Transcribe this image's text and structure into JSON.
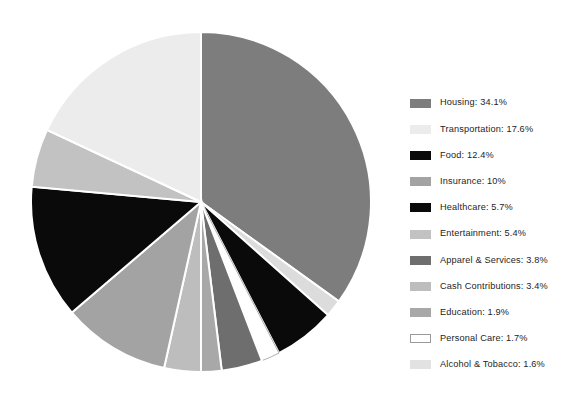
{
  "chart_data": {
    "type": "pie",
    "title": "",
    "categories": [
      "Housing",
      "Transportation",
      "Food",
      "Insurance",
      "Healthcare",
      "Entertainment",
      "Apparel & Services",
      "Cash Contributions",
      "Education",
      "Personal Care",
      "Alcohol & Tobacco"
    ],
    "values": [
      34.1,
      17.6,
      12.4,
      10,
      5.7,
      5.4,
      3.8,
      3.4,
      1.9,
      1.7,
      1.6
    ],
    "value_unit": "%",
    "start_angle_deg": 0,
    "direction": "clockwise",
    "legend_position": "right",
    "grid": false,
    "slice_order_clockwise_from_top": [
      "Housing",
      "Alcohol & Tobacco",
      "Healthcare",
      "Personal Care",
      "Apparel & Services",
      "Education",
      "Cash Contributions",
      "Insurance",
      "Food",
      "Entertainment",
      "Transportation"
    ],
    "colors": {
      "Housing": "#7d7d7d",
      "Transportation": "#ececec",
      "Food": "#0a0a0a",
      "Insurance": "#a3a3a3",
      "Healthcare": "#0a0a0a",
      "Entertainment": "#c2c2c2",
      "Apparel & Services": "#6e6e6e",
      "Cash Contributions": "#bdbdbd",
      "Education": "#a8a8a8",
      "Personal Care": "#ffffff",
      "Alcohol & Tobacco": "#dcdcdc"
    },
    "slice_border_color": "#ffffff",
    "personal_care_outline_color": "#9a9a9a"
  },
  "legend": {
    "items": [
      {
        "label": "Housing: 34.1%",
        "name": "housing",
        "color": "#7d7d7d",
        "outline": false
      },
      {
        "label": "Transportation: 17.6%",
        "name": "transportation",
        "color": "#ececec",
        "outline": false
      },
      {
        "label": "Food: 12.4%",
        "name": "food",
        "color": "#0a0a0a",
        "outline": false
      },
      {
        "label": "Insurance: 10%",
        "name": "insurance",
        "color": "#a3a3a3",
        "outline": false
      },
      {
        "label": "Healthcare: 5.7%",
        "name": "healthcare",
        "color": "#0a0a0a",
        "outline": false
      },
      {
        "label": "Entertainment: 5.4%",
        "name": "entertainment",
        "color": "#c2c2c2",
        "outline": false
      },
      {
        "label": "Apparel & Services: 3.8%",
        "name": "apparel-and-services",
        "color": "#6e6e6e",
        "outline": false
      },
      {
        "label": "Cash Contributions: 3.4%",
        "name": "cash-contributions",
        "color": "#bdbdbd",
        "outline": false
      },
      {
        "label": "Education: 1.9%",
        "name": "education",
        "color": "#a8a8a8",
        "outline": false
      },
      {
        "label": "Personal Care: 1.7%",
        "name": "personal-care",
        "color": "#ffffff",
        "outline": true
      },
      {
        "label": "Alcohol & Tobacco: 1.6%",
        "name": "alcohol-and-tobacco",
        "color": "#e2e2e2",
        "outline": false
      }
    ]
  },
  "pie_geometry": {
    "cx": 201,
    "cy": 202,
    "r": 170
  }
}
